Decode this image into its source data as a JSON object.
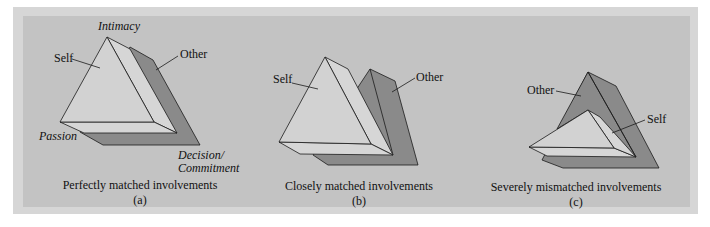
{
  "colors": {
    "frame": "#d6d6d6",
    "panel": "#c3c3c3",
    "self_face": "#d2d2d2",
    "other_face": "#8a8a8a",
    "outline": "#1a1a1a"
  },
  "diagrams": [
    {
      "id": "a",
      "labels": {
        "self": "Self",
        "other": "Other",
        "vertex_top": "Intimacy",
        "vertex_left": "Passion",
        "vertex_right_1": "Decision/",
        "vertex_right_2": "Commitment"
      },
      "caption": "Perfectly matched involvements",
      "sublabel": "(a)"
    },
    {
      "id": "b",
      "labels": {
        "self": "Self",
        "other": "Other"
      },
      "caption": "Closely matched involvements",
      "sublabel": "(b)"
    },
    {
      "id": "c",
      "labels": {
        "self": "Self",
        "other": "Other"
      },
      "caption": "Severely mismatched involvements",
      "sublabel": "(c)"
    }
  ]
}
